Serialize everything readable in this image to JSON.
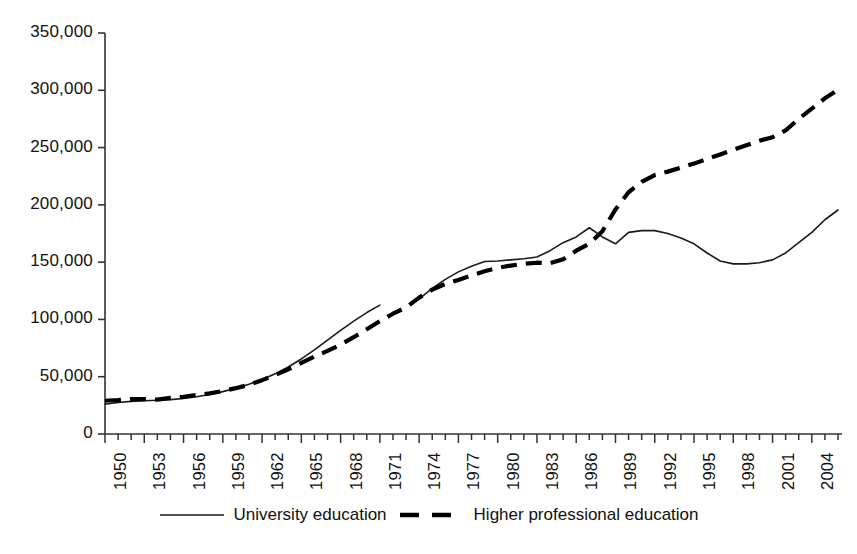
{
  "chart_data": {
    "type": "line",
    "title": "",
    "subtitle": "",
    "xlabel": "",
    "ylabel": "",
    "xlim": [
      1950,
      2006
    ],
    "ylim": [
      0,
      350000
    ],
    "grid": false,
    "legend_position": "bottom",
    "y_ticks": [
      0,
      50000,
      100000,
      150000,
      200000,
      250000,
      300000,
      350000
    ],
    "y_tick_labels": [
      "0",
      "50,000",
      "100,000",
      "150,000",
      "200,000",
      "250,000",
      "300,000",
      "350,000"
    ],
    "x_ticks": [
      1950,
      1953,
      1956,
      1959,
      1962,
      1965,
      1968,
      1971,
      1974,
      1977,
      1980,
      1983,
      1986,
      1989,
      1992,
      1995,
      1998,
      2001,
      2004
    ],
    "x_tick_labels": [
      "1950",
      "1953",
      "1956",
      "1959",
      "1962",
      "1965",
      "1968",
      "1971",
      "1974",
      "1977",
      "1980",
      "1983",
      "1986",
      "1989",
      "1992",
      "1995",
      "1998",
      "2001",
      "2004"
    ],
    "x_minor_tick_interval": 1,
    "series": [
      {
        "name": "University education",
        "style": "solid",
        "color": "#1a1a1a",
        "width": 1.6,
        "segments": [
          {
            "x": [
              1950,
              1951,
              1952,
              1953,
              1954,
              1955,
              1956,
              1957,
              1958,
              1959,
              1960,
              1961,
              1962,
              1963,
              1964,
              1965,
              1966,
              1967,
              1968,
              1969,
              1970,
              1971
            ],
            "y": [
              26000,
              27500,
              28500,
              29000,
              29500,
              30000,
              31000,
              32500,
              34500,
              37000,
              40000,
              43500,
              47500,
              52500,
              58500,
              65500,
              73500,
              82000,
              90500,
              98500,
              106000,
              112500
            ]
          },
          {
            "x": [
              1974,
              1975,
              1976,
              1977,
              1978,
              1979,
              1980,
              1981,
              1982,
              1983,
              1984,
              1985,
              1986,
              1987,
              1988,
              1989,
              1990,
              1991,
              1992,
              1993,
              1994,
              1995,
              1996,
              1997,
              1998,
              1999,
              2000,
              2001,
              2002,
              2003,
              2004,
              2005,
              2006
            ],
            "y": [
              118000,
              127000,
              135000,
              141500,
              146500,
              150500,
              151000,
              152000,
              153000,
              154500,
              160000,
              167000,
              172000,
              180000,
              172000,
              166000,
              176000,
              177500,
              177500,
              175000,
              171000,
              166000,
              158000,
              151000,
              148500,
              148500,
              149500,
              152000,
              158000,
              167000,
              176000,
              187000,
              195500
            ]
          }
        ]
      },
      {
        "name": "Higher professional education",
        "style": "dashed",
        "color": "#000000",
        "width": 4.2,
        "dash": "16 9",
        "segments": [
          {
            "x": [
              1950,
              1951,
              1952,
              1953,
              1954,
              1955,
              1956,
              1957,
              1958,
              1959,
              1960,
              1961,
              1962,
              1963,
              1964,
              1965,
              1966,
              1967,
              1968,
              1969,
              1970,
              1971,
              1972,
              1973,
              1974,
              1975,
              1976,
              1977,
              1978,
              1979,
              1980,
              1981,
              1982,
              1983,
              1984,
              1985,
              1986,
              1987,
              1988,
              1989,
              1990,
              1991,
              1992,
              1993,
              1994,
              1995,
              1996,
              1997,
              1998,
              1999,
              2000,
              2001,
              2002,
              2003,
              2004,
              2005,
              2006
            ],
            "y": [
              29000,
              29500,
              30500,
              30500,
              30000,
              31500,
              32500,
              34000,
              35500,
              37500,
              40000,
              43000,
              47000,
              51500,
              56500,
              62000,
              67500,
              72500,
              78000,
              84500,
              91500,
              98500,
              105000,
              110500,
              119000,
              126000,
              131000,
              134500,
              138500,
              142000,
              145000,
              147000,
              148500,
              149500,
              149000,
              152500,
              160000,
              166000,
              177000,
              196000,
              211000,
              220000,
              226000,
              229000,
              232500,
              236000,
              240000,
              244000,
              248000,
              252000,
              256000,
              259000,
              265000,
              275000,
              284000,
              293000,
              300500
            ]
          }
        ]
      }
    ]
  },
  "legend": {
    "entries": [
      {
        "label": "University education",
        "style": "solid"
      },
      {
        "label": "Higher professional education",
        "style": "dashed"
      }
    ]
  }
}
